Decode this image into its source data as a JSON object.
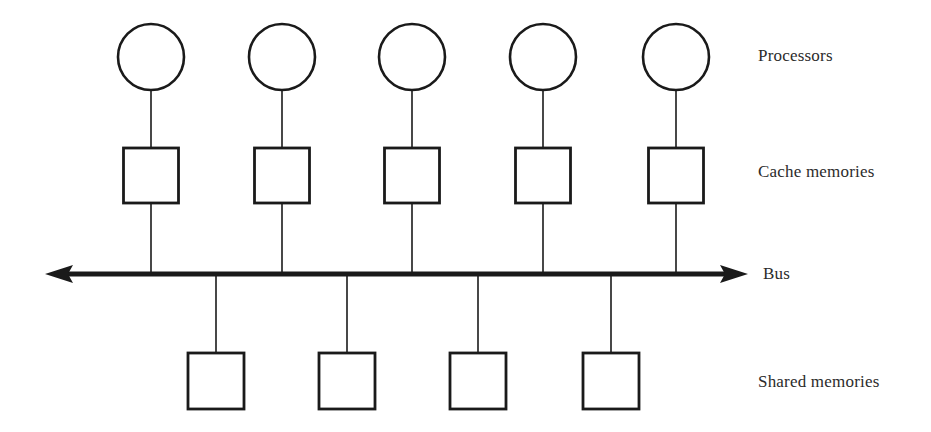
{
  "diagram": {
    "background_color": "#ffffff",
    "stroke_color": "#1a1a1a",
    "text_color": "#2b2b2b",
    "bus": {
      "label": "Bus",
      "y": 274,
      "x_start": 45,
      "x_end": 748,
      "thickness": 5,
      "arrow_left": true,
      "arrow_right": true,
      "arrowhead_name": "bus-arrowhead"
    },
    "rows": [
      {
        "id": "processors",
        "label": "Processors",
        "shape": "circle",
        "label_x": 758,
        "label_y": 56,
        "count": 5,
        "radius": 33,
        "center_y": 57,
        "centers_x": [
          151,
          282,
          412,
          543,
          676
        ]
      },
      {
        "id": "cache-memories",
        "label": "Cache memories",
        "shape": "square",
        "label_x": 758,
        "label_y": 172,
        "count": 5,
        "size": 55,
        "top_y": 148,
        "centers_x": [
          151,
          282,
          412,
          543,
          676
        ]
      },
      {
        "id": "shared-memories",
        "label": "Shared memories",
        "shape": "square",
        "label_x": 758,
        "label_y": 382,
        "count": 4,
        "size": 56,
        "top_y": 353,
        "centers_x": [
          216,
          347,
          478,
          611
        ]
      }
    ],
    "connectors": {
      "processor_to_cache": {
        "name": "processor-cache-connector",
        "y_top": 90,
        "y_bottom": 148
      },
      "cache_to_bus": {
        "name": "cache-bus-connector",
        "y_top": 203,
        "y_bottom": 274
      },
      "bus_to_shared": {
        "name": "bus-shared-connector",
        "y_top": 274,
        "y_bottom": 353
      }
    }
  }
}
